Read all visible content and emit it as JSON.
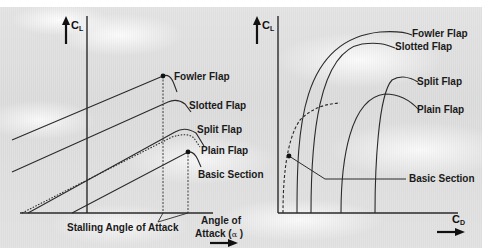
{
  "left_chart": {
    "y_axis": {
      "symbol": "C",
      "subscript": "L"
    },
    "x_axis_label_line1": "Angle of",
    "x_axis_label_line2": "Attack (",
    "x_axis_alpha": "α",
    "x_axis_label_close": " )",
    "annotation": "Stalling Angle of Attack",
    "curves": [
      {
        "name": "Fowler Flap"
      },
      {
        "name": "Slotted Flap"
      },
      {
        "name": "Split Flap"
      },
      {
        "name": "Plain Flap"
      },
      {
        "name": "Basic Section"
      }
    ]
  },
  "right_chart": {
    "y_axis": {
      "symbol": "C",
      "subscript": "L"
    },
    "x_axis": {
      "symbol": "C",
      "subscript": "D"
    },
    "curves": [
      {
        "name": "Fowler Flap"
      },
      {
        "name": "Slotted Flap"
      },
      {
        "name": "Split Flap"
      },
      {
        "name": "Plain Flap"
      },
      {
        "name": "Basic Section"
      }
    ]
  },
  "colors": {
    "line": "#2a2a2a",
    "background": "#dedede",
    "text": "#1a1a1a"
  }
}
